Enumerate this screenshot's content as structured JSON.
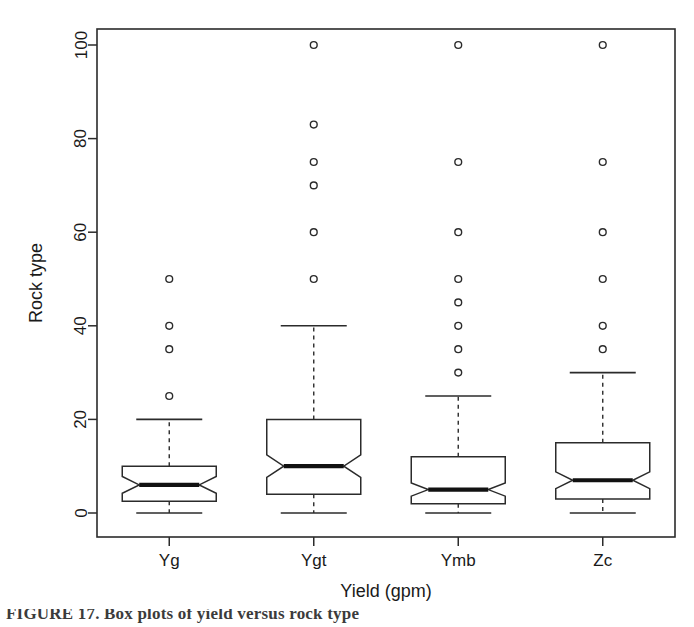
{
  "chart_data": {
    "type": "box",
    "title": "",
    "xlabel": "Yield (gpm)",
    "ylabel": "Rock type",
    "categories": [
      "Yg",
      "Ygt",
      "Ymb",
      "Zc"
    ],
    "ylim": [
      0,
      100
    ],
    "yticks": [
      0,
      20,
      40,
      60,
      80,
      100
    ],
    "ytick_labels": [
      "0",
      "20",
      "40",
      "60",
      "80",
      "100"
    ],
    "grid": false,
    "notched": true,
    "legend": "none",
    "series": [
      {
        "name": "Yg",
        "whisker_low": 0,
        "q1": 2.5,
        "median": 6,
        "q3": 10,
        "whisker_high": 20,
        "notch_low": 4.2,
        "notch_high": 7.8,
        "outliers": [
          25,
          35,
          40,
          50
        ]
      },
      {
        "name": "Ygt",
        "whisker_low": 0,
        "q1": 4,
        "median": 10,
        "q3": 20,
        "whisker_high": 40,
        "notch_low": 7.6,
        "notch_high": 12.4,
        "outliers": [
          50,
          60,
          70,
          75,
          83,
          100
        ]
      },
      {
        "name": "Ymb",
        "whisker_low": 0,
        "q1": 2,
        "median": 5,
        "q3": 12,
        "whisker_high": 25,
        "notch_low": 3.6,
        "notch_high": 6.4,
        "outliers": [
          30,
          35,
          40,
          45,
          50,
          60,
          75,
          100
        ]
      },
      {
        "name": "Zc",
        "whisker_low": 0,
        "q1": 3,
        "median": 7,
        "q3": 15,
        "whisker_high": 30,
        "notch_low": 5.2,
        "notch_high": 8.8,
        "outliers": [
          35,
          40,
          50,
          60,
          75,
          100
        ]
      }
    ]
  },
  "figure": {
    "caption_fragment": "FIGURE 17.  Box plots of yield versus rock type"
  },
  "colors": {
    "line": "#2b2b2b",
    "median": "#111111",
    "background": "#ffffff"
  }
}
